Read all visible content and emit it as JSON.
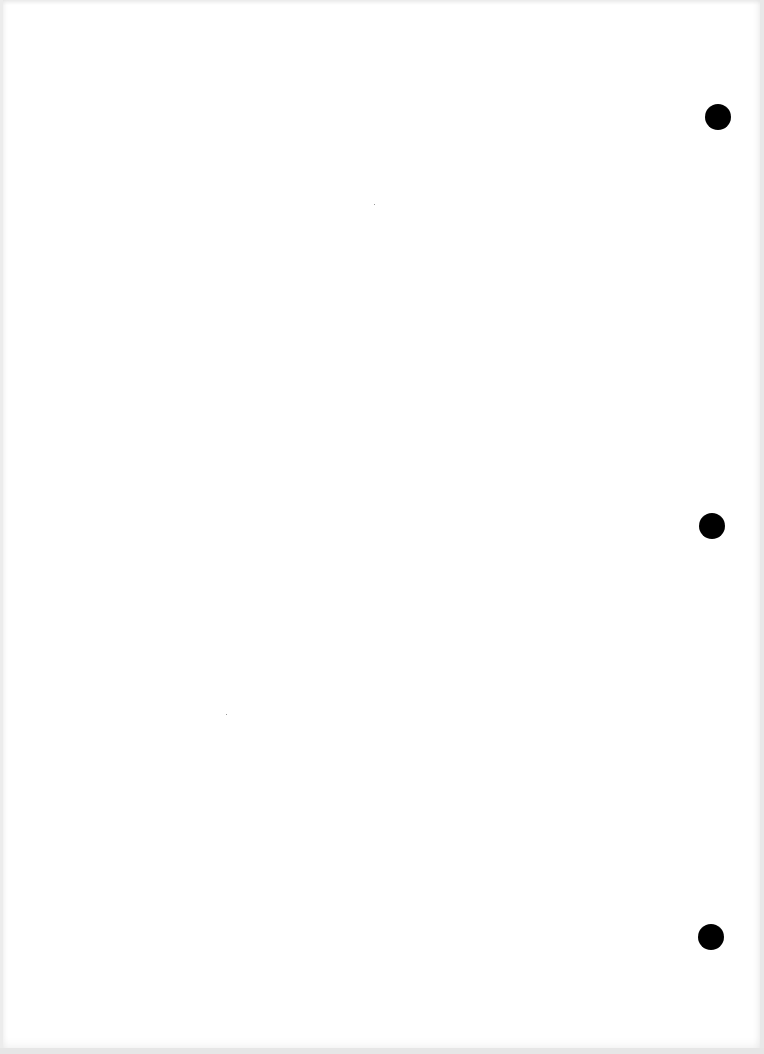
{
  "document": {
    "type": "blank scanned page",
    "background_color": "#ffffff",
    "text": "",
    "punch_holes": [
      {
        "cx": 718,
        "cy": 117,
        "diameter": 26,
        "color": "#000000"
      },
      {
        "cx": 712,
        "cy": 526,
        "diameter": 26,
        "color": "#000000"
      },
      {
        "cx": 711,
        "cy": 937,
        "diameter": 26,
        "color": "#000000"
      }
    ]
  }
}
